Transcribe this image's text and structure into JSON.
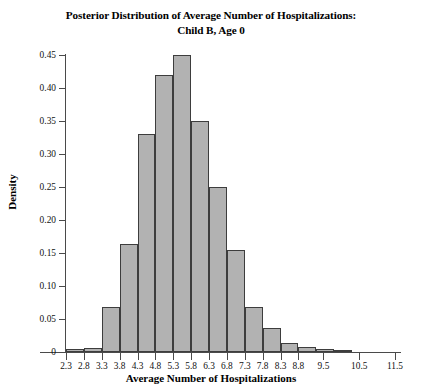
{
  "chart_data": {
    "type": "bar",
    "title": "Posterior Distribution of Average Number of Hospitalizations: Child B, Age 0",
    "title_line1": "Posterior Distribution of Average Number of Hospitalizations:",
    "title_line2": "Child B, Age 0",
    "xlabel": "Average Number of Hospitalizations",
    "ylabel": "Density",
    "grid": false,
    "legend": false,
    "bar_color": "#b2b2b2",
    "bar_edge_color": "#3d3d3d",
    "axis_color": "#4a4a4a",
    "xlim": [
      2.3,
      11.5
    ],
    "ylim": [
      0,
      0.45
    ],
    "xticks": [
      "2.3",
      "2.8",
      "3.3",
      "3.8",
      "4.3",
      "4.8",
      "5.3",
      "5.8",
      "6.3",
      "6.8",
      "7.3",
      "7.8",
      "8.3",
      "8.8",
      "9.5",
      "10.5",
      "11.5"
    ],
    "xtick_values": [
      2.3,
      2.8,
      3.3,
      3.8,
      4.3,
      4.8,
      5.3,
      5.8,
      6.3,
      6.8,
      7.3,
      7.8,
      8.3,
      8.8,
      9.5,
      10.5,
      11.5
    ],
    "yticks": [
      "0",
      "0.05",
      "0.10",
      "0.15",
      "0.20",
      "0.25",
      "0.30",
      "0.35",
      "0.40",
      "0.45"
    ],
    "ytick_values": [
      0,
      0.05,
      0.1,
      0.15,
      0.2,
      0.25,
      0.3,
      0.35,
      0.4,
      0.45
    ],
    "bin_edges": [
      2.3,
      2.8,
      3.3,
      3.8,
      4.3,
      4.8,
      5.3,
      5.8,
      6.3,
      6.8,
      7.3,
      7.8,
      8.3,
      8.8,
      9.3,
      9.8,
      10.3
    ],
    "categories": [
      "2.3-2.8",
      "2.8-3.3",
      "3.3-3.8",
      "3.8-4.3",
      "4.3-4.8",
      "4.8-5.3",
      "5.3-5.8",
      "5.8-6.3",
      "6.3-6.8",
      "6.8-7.3",
      "7.3-7.8",
      "7.8-8.3",
      "8.3-8.8",
      "8.8-9.3",
      "9.3-9.8",
      "9.8-10.3"
    ],
    "values": [
      0.004,
      0.006,
      0.068,
      0.163,
      0.33,
      0.42,
      0.45,
      0.35,
      0.25,
      0.155,
      0.068,
      0.037,
      0.014,
      0.008,
      0.005,
      0.003
    ]
  }
}
